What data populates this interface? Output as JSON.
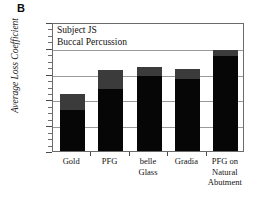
{
  "panel": {
    "label": "B"
  },
  "annotations": {
    "line1": "Subject JS",
    "line2": "Buccal Percussion"
  },
  "axes": {
    "ylabel": "Average Loss Coefficient",
    "xlabel": "",
    "yticks": [
      "0",
      "0.05",
      "0.1",
      "0.15",
      "0.2",
      "0.25"
    ]
  },
  "colors": {
    "bar_lower": "#060606",
    "bar_upper": "#3b3b3b",
    "gridline": "#9a9a9a",
    "frame": "#6b6b6b",
    "text": "#111111"
  },
  "xlabels": [
    {
      "line1": "Gold",
      "line2": "",
      "line3": ""
    },
    {
      "line1": "PFG",
      "line2": "",
      "line3": ""
    },
    {
      "line1": "belle",
      "line2": "Glass",
      "line3": ""
    },
    {
      "line1": "Gradia",
      "line2": "",
      "line3": ""
    },
    {
      "line1": "PFG on",
      "line2": "Natural",
      "line3": "Abutment"
    }
  ],
  "chart_data": {
    "type": "bar",
    "title": "",
    "subtitle": "",
    "xlabel": "",
    "ylabel": "Average Loss Coefficient",
    "ylim": [
      0,
      0.25
    ],
    "yticks": [
      0,
      0.05,
      0.1,
      0.15,
      0.2,
      0.25
    ],
    "grid": true,
    "legend": null,
    "stacked": true,
    "annotations": [
      "Subject JS",
      "Buccal Percussion"
    ],
    "categories": [
      "Gold",
      "PFG",
      "belle Glass",
      "Gradia",
      "PFG on Natural Abutment"
    ],
    "series": [
      {
        "name": "lower",
        "values": [
          0.08,
          0.12,
          0.145,
          0.14,
          0.185
        ]
      },
      {
        "name": "upper",
        "values": [
          0.03,
          0.037,
          0.017,
          0.018,
          0.01
        ]
      }
    ],
    "totals": [
      0.11,
      0.157,
      0.162,
      0.158,
      0.195
    ]
  }
}
